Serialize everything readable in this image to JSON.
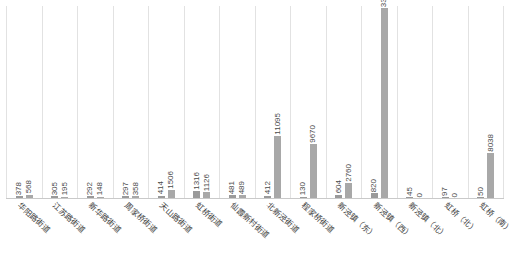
{
  "chart_data": {
    "type": "bar",
    "title": "",
    "subtitle": "",
    "xlabel": "",
    "ylabel": "",
    "ylim": [
      0,
      33937
    ],
    "grid": "vertical-category-separators",
    "legend": "none",
    "categories": [
      "华阳路街道",
      "江苏路街道",
      "新华路街道",
      "周家桥街道",
      "天山路街道",
      "虹桥街道",
      "仙霞新村街道",
      "北新泾街道",
      "程家桥街道",
      "新泾镇（东）",
      "新泾镇（西）",
      "新泾镇（北）",
      "虹桥（北）",
      "虹桥（南）"
    ],
    "series": [
      {
        "name": "series-a",
        "values": [
          378,
          305,
          292,
          297,
          414,
          1316,
          481,
          412,
          130,
          604,
          820,
          45,
          97,
          50
        ]
      },
      {
        "name": "series-b",
        "values": [
          568,
          195,
          148,
          358,
          1506,
          1126,
          489,
          11095,
          9670,
          2760,
          33937,
          0,
          0,
          8038
        ]
      }
    ],
    "value_labels": [
      [
        "378",
        "568"
      ],
      [
        "305",
        "195"
      ],
      [
        "292",
        "148"
      ],
      [
        "297",
        "358"
      ],
      [
        "414",
        "1506"
      ],
      [
        "1316",
        "1126"
      ],
      [
        "481",
        "489"
      ],
      [
        "412",
        "11095"
      ],
      [
        "130",
        "9670"
      ],
      [
        "604",
        "2760"
      ],
      [
        "820",
        "33937"
      ],
      [
        "45",
        "0"
      ],
      [
        "97",
        "0"
      ],
      [
        "50",
        "8038"
      ]
    ],
    "colors": {
      "series_a": "#9a9a9a",
      "series_b": "#a8a8a8",
      "axis": "#c9c9c9",
      "gridline": "#e2e2e2",
      "text": "#3c3c3c",
      "background": "#ffffff"
    }
  }
}
